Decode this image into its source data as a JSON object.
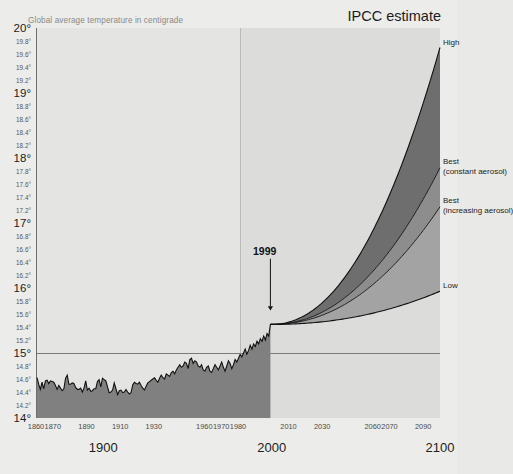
{
  "caption": "Global average temperature in centigrade",
  "ipcc_title": "IPCC estimate",
  "annotation": {
    "year_marker": "1999"
  },
  "scenarios": {
    "high": "High",
    "best_constant_line1": "Best",
    "best_constant_line2": "(constant aerosol)",
    "best_increasing_line1": "Best",
    "best_increasing_line2": "(increasing aerosol)",
    "low": "Low"
  },
  "colors": {
    "page_background": "#ececeb",
    "plot_historical_background": "#e4e4e2",
    "plot_future_background": "#dcdcda",
    "historical_fill": "#808080",
    "band_high": "#6e6e6e",
    "band_mid": "#8d8d8d",
    "band_low": "#a3a3a3",
    "curve_stroke": "#111111",
    "reference_line": "#7a7a78",
    "axis_line": "#6e6e6c",
    "caption_text": "#8a8a88",
    "tick_text": "#4a4a48"
  },
  "chart_data": {
    "type": "line",
    "title": "IPCC estimate",
    "subtitle": "Global average temperature in centigrade",
    "xlabel": "",
    "ylabel": "Global average temperature in centigrade",
    "xlim": [
      1860,
      2100
    ],
    "ylim": [
      14,
      20
    ],
    "grid": false,
    "legend_position": "right-inline-labels",
    "reference_lines": [
      {
        "orientation": "horizontal",
        "value": 15,
        "label": "15"
      },
      {
        "orientation": "vertical",
        "value": 1999,
        "label": "1999"
      }
    ],
    "y_ticks_major": [
      "15",
      "16",
      "17",
      "18",
      "19",
      "20"
    ],
    "y_ticks_minor": [
      "14.2",
      "14.4",
      "14.6",
      "14.8",
      "15.2",
      "15.4",
      "15.6",
      "15.8",
      "16.2",
      "16.4",
      "16.6",
      "16.8",
      "17.2",
      "17.4",
      "17.6",
      "17.8",
      "18.2",
      "18.4",
      "18.6",
      "18.8",
      "19.2",
      "19.4",
      "19.6",
      "19.8"
    ],
    "x_ticks_minor": [
      "1860",
      "1870",
      "1890",
      "1910",
      "1930",
      "1960",
      "1970",
      "1980",
      "2010",
      "2030",
      "2060",
      "2070",
      "2090"
    ],
    "x_ticks_major": [
      "1900",
      "2000",
      "2100"
    ],
    "series": [
      {
        "name": "Observed annual global average temperature",
        "type": "line-with-fill",
        "x_start": 1860,
        "x_end": 1999,
        "values": [
          14.62,
          14.52,
          14.44,
          14.55,
          14.45,
          14.57,
          14.58,
          14.53,
          14.57,
          14.56,
          14.55,
          14.5,
          14.44,
          14.5,
          14.46,
          14.42,
          14.45,
          14.61,
          14.66,
          14.52,
          14.52,
          14.54,
          14.53,
          14.47,
          14.44,
          14.44,
          14.46,
          14.4,
          14.46,
          14.57,
          14.43,
          14.46,
          14.41,
          14.42,
          14.45,
          14.45,
          14.56,
          14.59,
          14.48,
          14.61,
          14.59,
          14.57,
          14.48,
          14.39,
          14.4,
          14.43,
          14.54,
          14.45,
          14.36,
          14.42,
          14.43,
          14.39,
          14.4,
          14.44,
          14.4,
          14.37,
          14.39,
          14.51,
          14.55,
          14.53,
          14.52,
          14.55,
          14.5,
          14.46,
          14.43,
          14.49,
          14.54,
          14.56,
          14.58,
          14.6,
          14.62,
          14.58,
          14.55,
          14.61,
          14.66,
          14.62,
          14.6,
          14.68,
          14.66,
          14.64,
          14.7,
          14.72,
          14.68,
          14.74,
          14.78,
          14.82,
          14.78,
          14.8,
          14.86,
          14.84,
          14.76,
          14.9,
          14.92,
          14.84,
          14.88,
          14.86,
          14.8,
          14.78,
          14.82,
          14.74,
          14.72,
          14.78,
          14.8,
          14.72,
          14.7,
          14.76,
          14.82,
          14.78,
          14.74,
          14.8,
          14.86,
          14.78,
          14.72,
          14.8,
          14.88,
          14.84,
          14.76,
          14.82,
          14.9,
          14.86,
          14.92,
          14.98,
          14.94,
          15.0,
          15.06,
          14.98,
          15.04,
          15.12,
          15.06,
          15.14,
          15.1,
          15.18,
          15.14,
          15.22,
          15.18,
          15.26,
          15.2,
          15.3,
          15.26,
          15.44
        ],
        "end_value": 15.44,
        "value_1999": 15.44
      },
      {
        "name": "High",
        "type": "projection",
        "x_start": 1999,
        "x_end": 2100,
        "start_value": 15.44,
        "end_value": 19.7
      },
      {
        "name": "Best (constant aerosol)",
        "type": "projection",
        "x_start": 1999,
        "x_end": 2100,
        "start_value": 15.44,
        "end_value": 17.85
      },
      {
        "name": "Best (increasing aerosol)",
        "type": "projection",
        "x_start": 1999,
        "x_end": 2100,
        "start_value": 15.44,
        "end_value": 17.25
      },
      {
        "name": "Low",
        "type": "projection",
        "x_start": 1999,
        "x_end": 2100,
        "start_value": 15.44,
        "end_value": 15.95
      }
    ]
  }
}
